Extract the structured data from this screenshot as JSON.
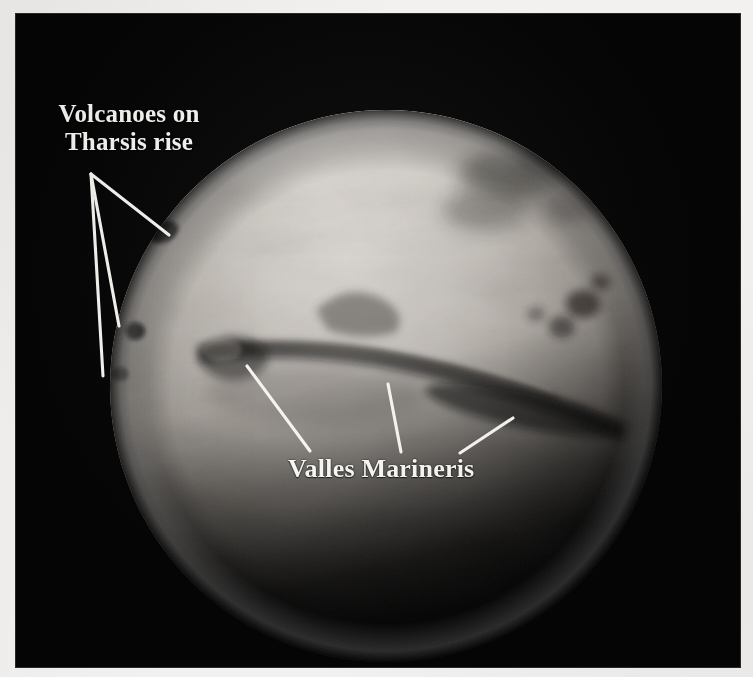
{
  "figure": {
    "background_color": "#050505",
    "page_color": "#f2f1ef",
    "annotation_color": "#f6f5f2",
    "plate": {
      "x": 16,
      "y": 14,
      "width": 724,
      "height": 653
    }
  },
  "planet": {
    "name": "mars-disc",
    "center_x": 370,
    "center_y": 372,
    "radius": 276,
    "bright_tone": "#d6d2cd",
    "mid_tone": "#9a958f",
    "dark_tone": "#2a2724",
    "shadow_tone": "#0a0a09"
  },
  "annotations": [
    {
      "id": "volcanoes",
      "name": "label-volcanoes-on-tharsis-rise",
      "line1": "Volcanoes on",
      "line2": "Tharsis rise",
      "apex": {
        "x": 75,
        "y": 160
      },
      "leaders": [
        {
          "x1": 75,
          "y1": 160,
          "x2": 153,
          "y2": 221
        },
        {
          "x1": 75,
          "y1": 160,
          "x2": 103,
          "y2": 312
        },
        {
          "x1": 75,
          "y1": 160,
          "x2": 87,
          "y2": 362
        }
      ]
    },
    {
      "id": "valles",
      "name": "label-valles-marineris",
      "text": "Valles Marineris",
      "leaders": [
        {
          "x1": 231,
          "y1": 352,
          "x2": 294,
          "y2": 437
        },
        {
          "x1": 372,
          "y1": 370,
          "x2": 385,
          "y2": 438
        },
        {
          "x1": 497,
          "y1": 404,
          "x2": 444,
          "y2": 439
        }
      ]
    }
  ],
  "albedo_features": [
    {
      "name": "syrtis-dark-patch-north",
      "cx": 495,
      "cy": 160,
      "rx": 48,
      "ry": 22,
      "opacity": 0.42
    },
    {
      "name": "dark-patch-northeast",
      "cx": 540,
      "cy": 185,
      "rx": 30,
      "ry": 16,
      "opacity": 0.34
    },
    {
      "name": "dark-patch-east-mid",
      "cx": 566,
      "cy": 290,
      "rx": 16,
      "ry": 13,
      "opacity": 0.5
    },
    {
      "name": "dark-patch-east-lower",
      "cx": 548,
      "cy": 315,
      "rx": 13,
      "ry": 10,
      "opacity": 0.45
    },
    {
      "name": "dark-spot-olympus-shadow",
      "cx": 148,
      "cy": 218,
      "rx": 13,
      "ry": 9,
      "opacity": 0.9
    },
    {
      "name": "dark-spot-tharsis-lower",
      "cx": 118,
      "cy": 318,
      "rx": 9,
      "ry": 8,
      "opacity": 0.8
    },
    {
      "name": "canyon-shadow-central",
      "cx": 370,
      "cy": 352,
      "rx": 145,
      "ry": 13,
      "opacity": 0.55
    },
    {
      "name": "canyon-shadow-east",
      "cx": 505,
      "cy": 395,
      "rx": 95,
      "ry": 15,
      "opacity": 0.6
    }
  ]
}
